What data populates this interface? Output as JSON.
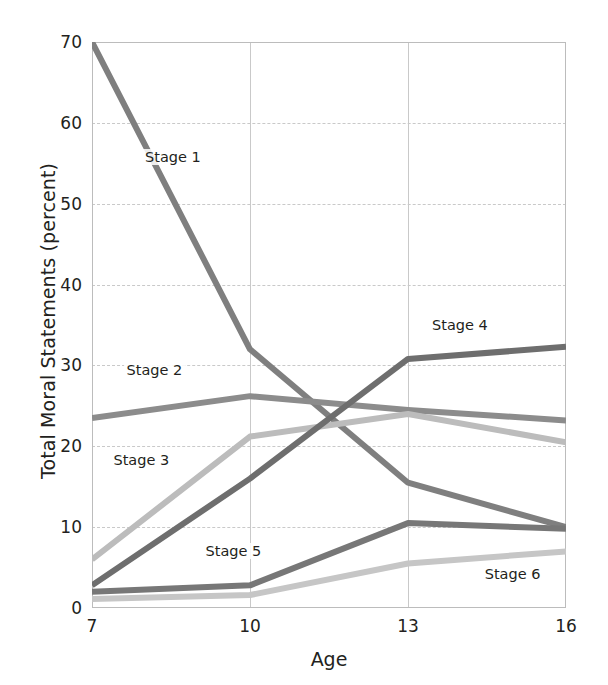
{
  "chart_data": {
    "type": "line",
    "title": "",
    "xlabel": "Age",
    "ylabel": "Total Moral Statements (percent)",
    "x": [
      7,
      10,
      13,
      16
    ],
    "xtick_labels": [
      "7",
      "10",
      "13",
      "16"
    ],
    "ytick_labels": [
      "0",
      "10",
      "20",
      "30",
      "40",
      "50",
      "60",
      "70"
    ],
    "yticks": [
      0,
      10,
      20,
      30,
      40,
      50,
      60,
      70
    ],
    "ylim": [
      0,
      70
    ],
    "xlim": [
      7,
      16
    ],
    "grid": "horizontal-dashed-and-vertical-solid",
    "legend": "inline-labels",
    "series": [
      {
        "name": "Stage 1",
        "values": [
          70,
          32,
          15.5,
          10
        ],
        "color": "#7f7f7f",
        "label_x": 7.95,
        "label_y": 55.5
      },
      {
        "name": "Stage 2",
        "values": [
          23.5,
          26.2,
          24.5,
          23.2
        ],
        "color": "#8c8c8c",
        "label_x": 7.6,
        "label_y": 29.2
      },
      {
        "name": "Stage 3",
        "values": [
          6.0,
          21.2,
          24.0,
          20.5
        ],
        "color": "#bcbcbc",
        "label_x": 7.35,
        "label_y": 18.0
      },
      {
        "name": "Stage 4",
        "values": [
          2.8,
          16.0,
          30.8,
          32.3
        ],
        "color": "#6e6e6e",
        "label_x": 13.4,
        "label_y": 34.8
      },
      {
        "name": "Stage 5",
        "values": [
          2.0,
          2.8,
          10.5,
          9.8
        ],
        "color": "#777777",
        "label_x": 9.1,
        "label_y": 6.8
      },
      {
        "name": "Stage 6",
        "values": [
          1.1,
          1.6,
          5.5,
          7.0
        ],
        "color": "#c6c6c6",
        "label_x": 14.4,
        "label_y": 4.0
      }
    ]
  },
  "axes": {
    "x_title": "Age",
    "y_title": "Total Moral Statements (percent)"
  }
}
